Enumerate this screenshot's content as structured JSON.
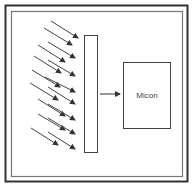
{
  "diagram": {
    "micon_label": "Micon",
    "colors": {
      "outer_frame": "#333333",
      "inner_frame": "#777777",
      "stroke": "#444444",
      "background": "#ffffff"
    },
    "incoming_arrows": [
      {
        "x1": 51,
        "y1": 21,
        "x2": 78,
        "y2": 38
      },
      {
        "x1": 44,
        "y1": 28,
        "x2": 72,
        "y2": 45
      },
      {
        "x1": 48,
        "y1": 42,
        "x2": 75,
        "y2": 58
      },
      {
        "x1": 38,
        "y1": 45,
        "x2": 65,
        "y2": 62
      },
      {
        "x1": 34,
        "y1": 56,
        "x2": 61,
        "y2": 73
      },
      {
        "x1": 48,
        "y1": 60,
        "x2": 75,
        "y2": 76
      },
      {
        "x1": 32,
        "y1": 70,
        "x2": 60,
        "y2": 87
      },
      {
        "x1": 45,
        "y1": 77,
        "x2": 75,
        "y2": 92
      },
      {
        "x1": 30,
        "y1": 83,
        "x2": 58,
        "y2": 100
      },
      {
        "x1": 48,
        "y1": 87,
        "x2": 75,
        "y2": 104
      },
      {
        "x1": 38,
        "y1": 99,
        "x2": 65,
        "y2": 116
      },
      {
        "x1": 48,
        "y1": 104,
        "x2": 75,
        "y2": 120
      },
      {
        "x1": 38,
        "y1": 114,
        "x2": 65,
        "y2": 130
      },
      {
        "x1": 48,
        "y1": 118,
        "x2": 75,
        "y2": 134
      },
      {
        "x1": 31,
        "y1": 128,
        "x2": 58,
        "y2": 145
      },
      {
        "x1": 48,
        "y1": 132,
        "x2": 75,
        "y2": 149
      }
    ]
  }
}
